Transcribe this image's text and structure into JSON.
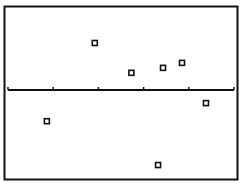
{
  "chart_data": {
    "type": "scatter",
    "title": "",
    "xlabel": "",
    "ylabel": "",
    "x_ticks": [
      0,
      1,
      2,
      3,
      4,
      5
    ],
    "x_tick_labels": [],
    "xlim": [
      0,
      5
    ],
    "ylim": [
      -1.9,
      1.85
    ],
    "grid": false,
    "legend": null,
    "marker": "hollow-square",
    "colors": {
      "ink": "#111111",
      "background": "#ffffff"
    },
    "points": [
      {
        "x": 0.86,
        "y": -0.69
      },
      {
        "x": 1.92,
        "y": 1.04
      },
      {
        "x": 2.73,
        "y": 0.38
      },
      {
        "x": 3.32,
        "y": -1.66
      },
      {
        "x": 3.43,
        "y": 0.49
      },
      {
        "x": 3.85,
        "y": 0.6
      },
      {
        "x": 4.38,
        "y": -0.29
      }
    ]
  }
}
